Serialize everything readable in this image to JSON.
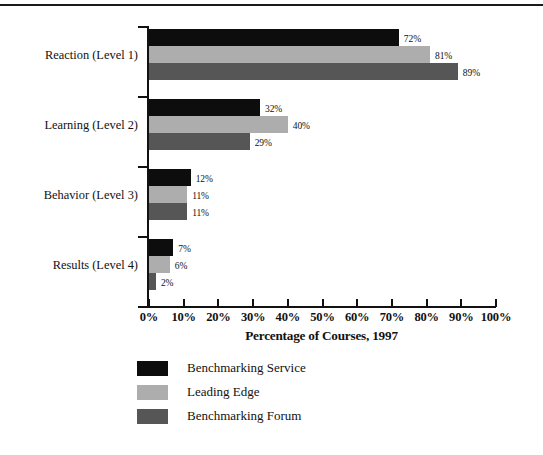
{
  "chart_data": {
    "type": "bar",
    "orientation": "horizontal",
    "title": "",
    "xlabel": "Percentage of Courses, 1997",
    "ylabel": "",
    "xlim": [
      0,
      100
    ],
    "xtick_labels": [
      "0%",
      "10%",
      "20%",
      "30%",
      "40%",
      "50%",
      "60%",
      "70%",
      "80%",
      "90%",
      "100%"
    ],
    "xticks": [
      0,
      10,
      20,
      30,
      40,
      50,
      60,
      70,
      80,
      90,
      100
    ],
    "grid": false,
    "legend_position": "below-axis-left",
    "categories": [
      "Reaction (Level 1)",
      "Learning (Level 2)",
      "Behavior (Level 3)",
      "Results (Level 4)"
    ],
    "series": [
      {
        "name": "Benchmarking Service",
        "color": "#0d0d0d",
        "values": [
          72,
          81,
          89,
          32
        ],
        "note": "placeholder-overridden-below"
      }
    ],
    "series_by_group": [
      {
        "name": "Benchmarking Service",
        "color": "#0d0d0d",
        "values": [
          72,
          32,
          12,
          7
        ],
        "value_labels": [
          "72%",
          "32%",
          "12%",
          "7%"
        ]
      },
      {
        "name": "Leading Edge",
        "color": "#adadad",
        "values": [
          81,
          40,
          11,
          6
        ],
        "value_labels": [
          "81%",
          "40%",
          "11%",
          "6%"
        ]
      },
      {
        "name": "Benchmarking Forum",
        "color": "#565656",
        "values": [
          89,
          29,
          11,
          2
        ],
        "value_labels": [
          "89%",
          "29%",
          "11%",
          "2%"
        ]
      }
    ]
  },
  "legend": {
    "items": [
      {
        "label": "Benchmarking Service",
        "color": "#0d0d0d"
      },
      {
        "label": "Leading Edge",
        "color": "#adadad"
      },
      {
        "label": "Benchmarking Forum",
        "color": "#565656"
      }
    ]
  },
  "axis": {
    "x_title": "Percentage of Courses, 1997"
  },
  "colors": {
    "series_1": "#0d0d0d",
    "series_2": "#adadad",
    "series_3": "#565656",
    "axis": "#111111",
    "background": "#ffffff"
  }
}
